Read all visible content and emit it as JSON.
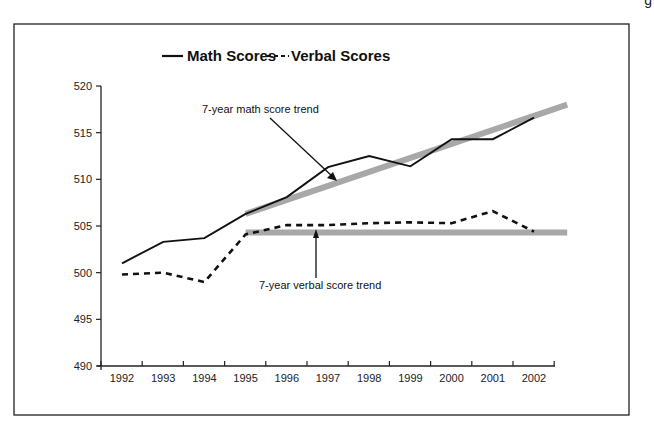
{
  "chart_data": {
    "type": "line",
    "title": "",
    "xlabel": "",
    "ylabel": "",
    "x": [
      "1992",
      "1993",
      "1994",
      "1995",
      "1996",
      "1997",
      "1998",
      "1999",
      "2000",
      "2001",
      "2002"
    ],
    "series": [
      {
        "name": "Math Scores",
        "style": "solid",
        "color": "#111111",
        "values": [
          501.0,
          503.3,
          503.7,
          506.3,
          508.1,
          511.3,
          512.5,
          511.4,
          514.3,
          514.3,
          516.6
        ]
      },
      {
        "name": "Verbal Scores",
        "style": "dashed",
        "color": "#111111",
        "values": [
          499.8,
          500.0,
          499.0,
          504.1,
          505.1,
          505.1,
          505.3,
          505.4,
          505.3,
          506.6,
          504.4
        ]
      }
    ],
    "trendlines": [
      {
        "name": "7-year math score trend",
        "color": "#a8a8a8",
        "from": {
          "x": "1995",
          "y": 506.3
        },
        "to": {
          "x": "2003",
          "y": 518.0
        }
      },
      {
        "name": "7-year verbal score trend",
        "color": "#a8a8a8",
        "from": {
          "x": "1995",
          "y": 504.3
        },
        "to": {
          "x": "2003",
          "y": 504.3
        }
      }
    ],
    "annotations": [
      {
        "text": "7-year math score trend",
        "points_to": "math trendline near 1997"
      },
      {
        "text": "7-year verbal score trend",
        "points_to": "verbal trendline near 1997"
      }
    ],
    "yticks": [
      490,
      495,
      500,
      505,
      510,
      515,
      520
    ],
    "ylim": [
      490,
      520
    ],
    "grid": false,
    "legend_position": "top-center"
  },
  "legend": {
    "math_label": "Math Scores",
    "verbal_label": "Verbal Scores"
  },
  "annotations": {
    "math_trend": "7-year math score trend",
    "verbal_trend": "7-year verbal score trend"
  },
  "corner_mark": "g"
}
